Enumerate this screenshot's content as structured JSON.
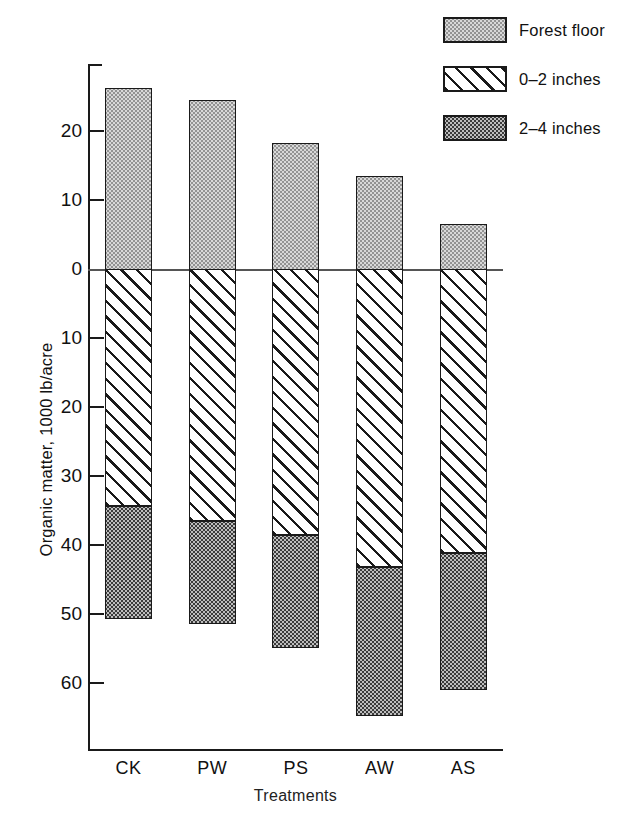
{
  "chart_data": {
    "type": "bar",
    "title": "",
    "subtitle": "",
    "xlabel": "Treatments",
    "ylabel": "Organic matter, 1000 lb/acre",
    "categories": [
      "CK",
      "PW",
      "PS",
      "AW",
      "AS"
    ],
    "grid": false,
    "legend_position": "top-right",
    "stacked": true,
    "axis": {
      "zero_value": 0,
      "above_zero_max": 28,
      "below_zero_max": 68,
      "tick_labels_above": [
        "20",
        "10",
        "0"
      ],
      "tick_labels_below": [
        "10",
        "20",
        "30",
        "40",
        "50",
        "60"
      ],
      "tick_values": [
        20,
        10,
        0,
        -10,
        -20,
        -30,
        -40,
        -50,
        -60
      ],
      "tick_text": [
        "20",
        "10",
        "0",
        "10",
        "20",
        "30",
        "40",
        "50",
        "60"
      ]
    },
    "series": [
      {
        "name": "Forest floor",
        "direction": "above",
        "pattern": "stipple-light",
        "color": "#d8d8d8",
        "values": [
          26.2,
          24.5,
          18.2,
          13.5,
          6.5
        ]
      },
      {
        "name": "0-2 inches",
        "direction": "below",
        "pattern": "diagonal-hatch",
        "color": "#ffffff",
        "values": [
          34.3,
          36.5,
          38.6,
          43.2,
          41.2
        ]
      },
      {
        "name": "2-4 inches",
        "direction": "below",
        "pattern": "stipple-dark",
        "color": "#3a3a3a",
        "values": [
          50.7,
          51.5,
          55.0,
          64.8,
          61.0
        ]
      }
    ],
    "segment_boundaries_note": "0-2 inches spans 0 to its value; 2-4 inches spans from the 0-2 value down to its value"
  },
  "legend": {
    "items": [
      {
        "label": "Forest floor",
        "swatch": "stipple-light-swatch"
      },
      {
        "label": "0–2 inches",
        "swatch": "diagonal-hatch-swatch"
      },
      {
        "label": "2–4 inches",
        "swatch": "stipple-dark-swatch"
      }
    ]
  },
  "axes": {
    "y_title": "Organic matter, 1000 lb/acre",
    "x_title": "Treatments",
    "y_ticks": [
      "20",
      "10",
      "0",
      "10",
      "20",
      "30",
      "40",
      "50",
      "60"
    ],
    "x_ticks": [
      "CK",
      "PW",
      "PS",
      "AW",
      "AS"
    ]
  }
}
